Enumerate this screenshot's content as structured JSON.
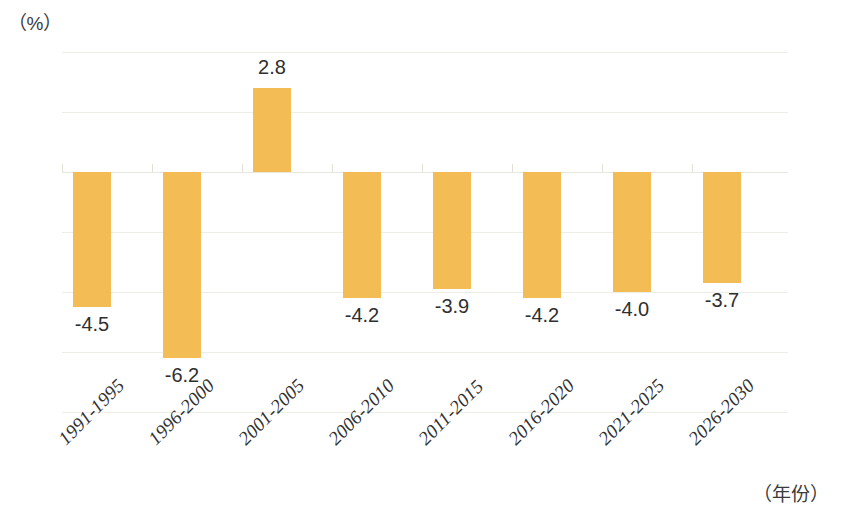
{
  "chart_data": {
    "type": "bar",
    "title": "",
    "subtitle": "",
    "xlabel": "（年份）",
    "ylabel": "（%）",
    "categories": [
      "1991-1995",
      "1996-2000",
      "2001-2005",
      "2006-2010",
      "2011-2015",
      "2016-2020",
      "2021-2025",
      "2026-2030"
    ],
    "values": [
      -4.5,
      -6.2,
      2.8,
      -4.2,
      -3.9,
      -4.2,
      -4.0,
      -3.7
    ],
    "data_labels": [
      "-4.5",
      "-6.2",
      "2.8",
      "-4.2",
      "-3.9",
      "-4.2",
      "-4.0",
      "-3.7"
    ],
    "ylim": [
      -8,
      4
    ],
    "ytick_labels": [
      "4",
      "2",
      "0",
      "-2",
      "-4",
      "-6",
      "-8"
    ],
    "ytick_values": [
      4,
      2,
      0,
      -2,
      -4,
      -6,
      -8
    ],
    "grid": true,
    "legend": "none",
    "bar_color": "#f3bc55",
    "gridline_color": "#efeee6",
    "text_color": "#2f2f2f",
    "background_color": "#ffffff",
    "xtick_label_rotation": -45
  }
}
